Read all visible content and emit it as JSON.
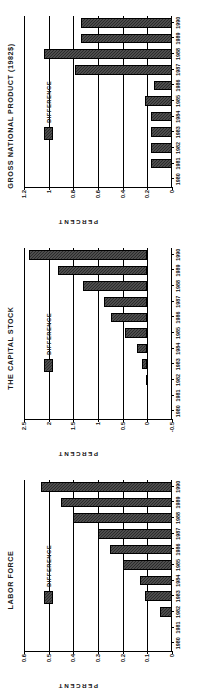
{
  "page": {
    "background": "#ffffff",
    "bar_color": "#2b2b2b",
    "axis_color": "#000000",
    "orientation": "panels-rotated-90-ccw"
  },
  "panels": [
    {
      "id": "gnp",
      "chart_data": {
        "type": "bar",
        "title": "GROSS NATIONAL PRODUCT (1982$)",
        "xlabel": "",
        "ylabel": "PERCENT",
        "legend": [
          "DIFFERENCE"
        ],
        "legend_position": "inside-upper-left",
        "grid": true,
        "ylim": [
          0,
          1.2
        ],
        "yticks": [
          0,
          0.2,
          0.4,
          0.6,
          0.8,
          1,
          1.2
        ],
        "ytick_labels": [
          "0",
          "0.2",
          "0.4",
          "0.6",
          "0.8",
          "1",
          "1.2"
        ],
        "categories": [
          "1980",
          "1981",
          "1982",
          "1983",
          "1984",
          "1985",
          "1986",
          "1987",
          "1988",
          "1989",
          "1990"
        ],
        "series": [
          {
            "name": "DIFFERENCE",
            "values": [
              0,
              0.17,
              0.17,
              0.17,
              0.17,
              0.22,
              0.15,
              0.79,
              1.04,
              0.74,
              0.74
            ]
          }
        ]
      }
    },
    {
      "id": "capital",
      "chart_data": {
        "type": "bar",
        "title": "THE CAPITAL STOCK",
        "xlabel": "",
        "ylabel": "PERCENT",
        "legend": [
          "DIFFERENCE"
        ],
        "legend_position": "inside-upper-left",
        "grid": true,
        "ylim": [
          -0.5,
          2.5
        ],
        "yticks": [
          -0.5,
          0,
          0.5,
          1,
          1.5,
          2,
          2.5
        ],
        "ytick_labels": [
          "-0.5",
          "0",
          "0.5",
          "1",
          "1.5",
          "2",
          "2.5"
        ],
        "categories": [
          "1980",
          "1981",
          "1982",
          "1983",
          "1984",
          "1985",
          "1986",
          "1987",
          "1988",
          "1989",
          "1990"
        ],
        "series": [
          {
            "name": "DIFFERENCE",
            "values": [
              0,
              0,
              0.02,
              0.1,
              0.21,
              0.45,
              0.73,
              0.88,
              1.3,
              1.82,
              2.4
            ]
          }
        ]
      }
    },
    {
      "id": "labor",
      "chart_data": {
        "type": "bar",
        "title": "LABOR FORCE",
        "xlabel": "",
        "ylabel": "PERCENT",
        "legend": [
          "DIFFERENCE"
        ],
        "legend_position": "inside-upper-left",
        "grid": true,
        "ylim": [
          0,
          0.6
        ],
        "yticks": [
          0,
          0.1,
          0.2,
          0.3,
          0.4,
          0.5,
          0.6
        ],
        "ytick_labels": [
          "0",
          "0.1",
          "0.2",
          "0.3",
          "0.4",
          "0.5",
          "0.6"
        ],
        "categories": [
          "1980",
          "1981",
          "1982",
          "1983",
          "1984",
          "1985",
          "1986",
          "1987",
          "1988",
          "1989",
          "1990"
        ],
        "series": [
          {
            "name": "DIFFERENCE",
            "values": [
              0,
              0,
              0.05,
              0.11,
              0.13,
              0.2,
              0.25,
              0.3,
              0.4,
              0.45,
              0.53
            ]
          }
        ]
      }
    }
  ]
}
